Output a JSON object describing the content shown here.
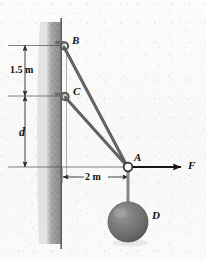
{
  "figure": {
    "type": "statics-free-body-diagram",
    "background_color": "#fbfbfa",
    "wall": {
      "name": "vertical-wall",
      "color": "#9c9c9c",
      "edge_color": "#6d6d6d"
    },
    "dimensions": [
      {
        "id": "d1",
        "label": "1.5 m",
        "value": 1.5,
        "unit": "m",
        "orientation": "vertical",
        "between": [
          "B",
          "C"
        ]
      },
      {
        "id": "d2",
        "label": "d",
        "value": null,
        "unit": "m",
        "orientation": "vertical",
        "between": [
          "C",
          "A-level"
        ]
      },
      {
        "id": "d3",
        "label": "2 m",
        "value": 2,
        "unit": "m",
        "orientation": "horizontal",
        "between": [
          "wall",
          "A"
        ]
      }
    ],
    "points": [
      {
        "id": "B",
        "label": "B",
        "kind": "wall-anchor-eyelet"
      },
      {
        "id": "C",
        "label": "C",
        "kind": "wall-anchor-eyelet"
      },
      {
        "id": "A",
        "label": "A",
        "kind": "ring-joint"
      },
      {
        "id": "D",
        "label": "D",
        "kind": "sphere-weight"
      }
    ],
    "cables": [
      {
        "id": "BA",
        "from": "B",
        "to": "A",
        "color": "#5d5d5d"
      },
      {
        "id": "CA",
        "from": "C",
        "to": "A",
        "color": "#5d5d5d"
      },
      {
        "id": "AD",
        "from": "A",
        "to": "D",
        "color": "#7a7a7a"
      }
    ],
    "force": {
      "label": "F",
      "direction": "horizontal-right",
      "applied_at": "A",
      "color": "#111111"
    },
    "ball": {
      "label": "D",
      "fill_color": "#6f6f6f",
      "highlight_color": "#a2a2a2",
      "shadow_color": "#4a4a4a"
    },
    "colors": {
      "line": "#3c3c3c",
      "cable": "#5d5d5d",
      "text": "#111111",
      "wall_fill": "#9c9c9c"
    }
  }
}
